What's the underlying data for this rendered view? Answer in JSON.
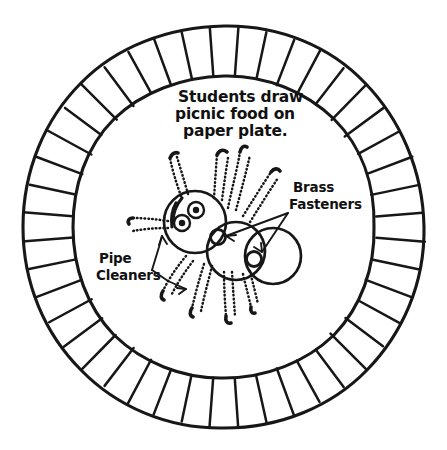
{
  "figure": {
    "medium": "hand-drawn line art",
    "ink_color": "#171717",
    "background_color": "#ffffff"
  },
  "caption": {
    "name": "instruction-caption",
    "lines": [
      "Students draw",
      "picnic food on",
      "paper plate."
    ]
  },
  "callouts": [
    {
      "id": "brass-fasteners",
      "lines": [
        "Brass",
        "Fasteners"
      ],
      "position": "right",
      "points_to": [
        "head-body-joint",
        "body-abdomen-joint"
      ],
      "leader_count": 2
    },
    {
      "id": "pipe-cleaners",
      "lines": [
        "Pipe",
        "Cleaners"
      ],
      "position": "left",
      "points_to": [
        "left-antenna-leg",
        "lower-left-leg"
      ],
      "leader_count": 2
    }
  ],
  "plate": {
    "name": "paper-plate-rim",
    "center_x": 224,
    "center_y": 227,
    "outer_radius": 201,
    "inner_radius": 151,
    "tick_count": 44,
    "description": "fluted paper plate edge drawn as radial ridges between two circles"
  },
  "spider": {
    "name": "spider-figure",
    "segments": [
      {
        "id": "head",
        "cx": 195,
        "cy": 222,
        "r": 31
      },
      {
        "id": "thorax",
        "cx": 236,
        "cy": 251,
        "r": 29
      },
      {
        "id": "abdomen",
        "cx": 273,
        "cy": 256,
        "r": 28
      }
    ],
    "eyes": [
      {
        "id": "eye-upper",
        "cx": 196,
        "cy": 210,
        "r": 8,
        "pupil_r": 3.2
      },
      {
        "id": "eye-lower",
        "cx": 182,
        "cy": 223,
        "r": 8,
        "pupil_r": 3.2
      }
    ],
    "fasteners": [
      {
        "id": "head-body-joint",
        "cx": 218,
        "cy": 237,
        "r": 7.5
      },
      {
        "id": "body-abdomen-joint",
        "cx": 254,
        "cy": 259,
        "r": 7.5
      }
    ],
    "leg_count": 9,
    "leg_style": "fuzzy dotted pipe cleaner with solid tip"
  }
}
